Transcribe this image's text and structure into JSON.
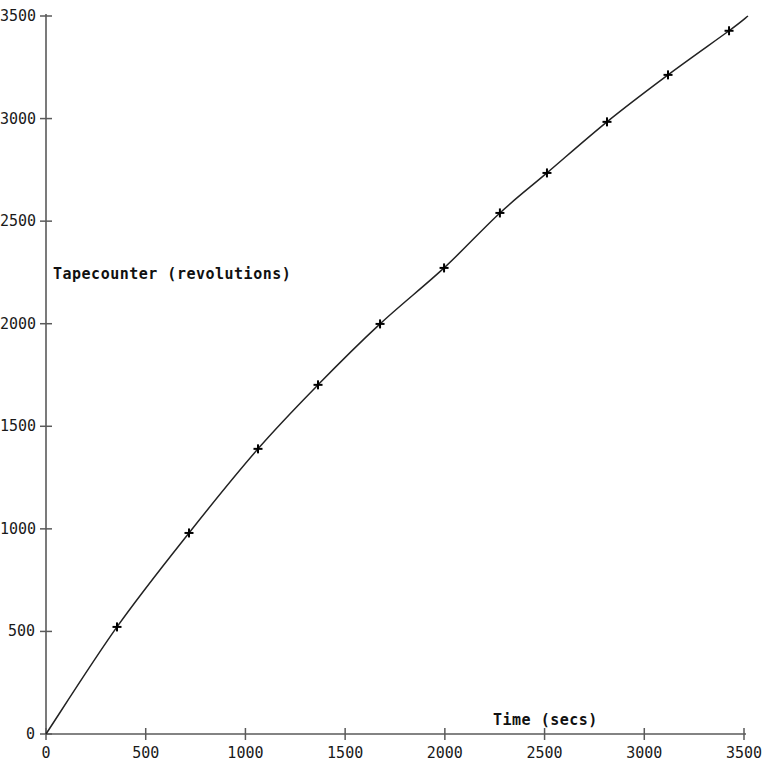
{
  "chart_data": {
    "type": "line",
    "title": "",
    "xlabel": "Time (secs)",
    "ylabel": "Tapecounter (revolutions)",
    "xlim": [
      0,
      3500
    ],
    "ylim": [
      0,
      3500
    ],
    "grid": false,
    "legend": null,
    "marker": "plus",
    "line_color": "#222222",
    "marker_color": "#000000",
    "axis_color": "#555555",
    "background": "#ffffff",
    "xticks": [
      0,
      500,
      1000,
      1500,
      2000,
      2500,
      3000,
      3500
    ],
    "yticks": [
      0,
      500,
      1000,
      1500,
      2000,
      2500,
      3000,
      3500
    ],
    "xtick_labels": [
      "0",
      "500",
      "1000",
      "1500",
      "2000",
      "2500",
      "3000",
      "3500"
    ],
    "ytick_labels": [
      "0",
      "500",
      "1000",
      "1500",
      "2000",
      "2500",
      "3000",
      "3500"
    ],
    "series": [
      {
        "name": "Tapecounter vs Time",
        "x": [
          0,
          356,
          717,
          1063,
          1364,
          1675,
          1996,
          2276,
          2512,
          2813,
          3119,
          3425,
          3520
        ],
        "y": [
          0,
          522,
          980,
          1390,
          1702,
          1999,
          2272,
          2540,
          2735,
          2984,
          3213,
          3428,
          3500
        ],
        "marker_points": [
          {
            "x": 356,
            "y": 522
          },
          {
            "x": 717,
            "y": 980
          },
          {
            "x": 1063,
            "y": 1390
          },
          {
            "x": 1364,
            "y": 1702
          },
          {
            "x": 1675,
            "y": 1999
          },
          {
            "x": 1996,
            "y": 2272
          },
          {
            "x": 2276,
            "y": 2540
          },
          {
            "x": 2512,
            "y": 2735
          },
          {
            "x": 2813,
            "y": 2984
          },
          {
            "x": 3119,
            "y": 3213
          },
          {
            "x": 3425,
            "y": 3428
          }
        ]
      }
    ]
  },
  "axes": {
    "x_title": "Time (secs)",
    "y_title": "Tapecounter (revolutions)"
  }
}
